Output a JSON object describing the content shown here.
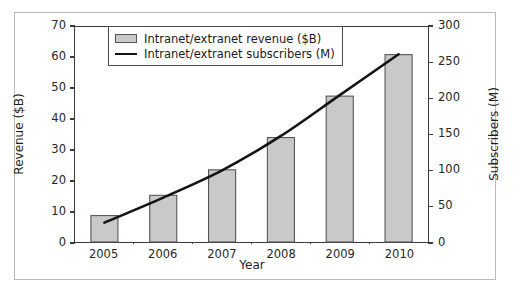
{
  "chart_data": {
    "type": "bar",
    "title": "",
    "categories": [
      "2005",
      "2006",
      "2007",
      "2008",
      "2009",
      "2010"
    ],
    "xlabel": "Year",
    "ylabel": "Revenue ($B)",
    "ylabel_right": "Subscribers (M)",
    "ylim": [
      0,
      70
    ],
    "ylim_right": [
      0,
      300
    ],
    "yticks": [
      "0",
      "10",
      "20",
      "30",
      "40",
      "50",
      "60",
      "70"
    ],
    "ytick_values": [
      0,
      10,
      20,
      30,
      40,
      50,
      60,
      70
    ],
    "yticks_right": [
      "0",
      "50",
      "100",
      "150",
      "200",
      "250",
      "300"
    ],
    "ytick_values_right": [
      0,
      50,
      100,
      150,
      200,
      250,
      300
    ],
    "grid": false,
    "legend_position": "upper left",
    "series": [
      {
        "name": "Intranet/extranet revenue ($B)",
        "kind": "bar",
        "axis": "left",
        "values": [
          8.6,
          15.2,
          23.5,
          34.0,
          47.5,
          61.0
        ],
        "fill_color": "#c9c9c9",
        "edge_color": "#555555"
      },
      {
        "name": "Intranet/extranet subscribers (M)",
        "kind": "line",
        "axis": "right",
        "values": [
          27,
          62,
          100,
          148,
          205,
          262
        ],
        "line_color": "#141414"
      }
    ]
  },
  "legend": {
    "items": [
      {
        "label": "Intranet/extranet revenue ($B)",
        "swatch": "bar-swatch"
      },
      {
        "label": "Intranet/extranet subscribers (M)",
        "swatch": "line-swatch"
      }
    ]
  },
  "colors": {
    "bar_fill": "#c9c9c9",
    "bar_edge": "#555555",
    "line": "#141414",
    "axis": "#3b3b3b",
    "frame": "#b9b9b9",
    "text": "#1f1f1f"
  }
}
